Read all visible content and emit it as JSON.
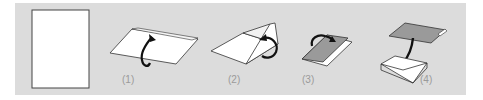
{
  "diagram": {
    "type": "instruction-steps",
    "background_color": "#dcdcdc",
    "steps": [
      {
        "label": "",
        "name": "unfolded-sheet"
      },
      {
        "label": "(1)",
        "name": "fold-bottom-up"
      },
      {
        "label": "(2)",
        "name": "fold-top-back"
      },
      {
        "label": "(3)",
        "name": "fold-in-half"
      },
      {
        "label": "(4)",
        "name": "insert-into-envelope"
      }
    ]
  }
}
